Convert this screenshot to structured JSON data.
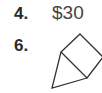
{
  "problems": [
    {
      "number": "4.",
      "answer": "$30"
    },
    {
      "number": "6.",
      "answer_figure": "square-with-attached-triangle"
    }
  ],
  "colors": {
    "text": "#2a2a2a",
    "answer_text": "#444444",
    "stroke": "#333333"
  }
}
